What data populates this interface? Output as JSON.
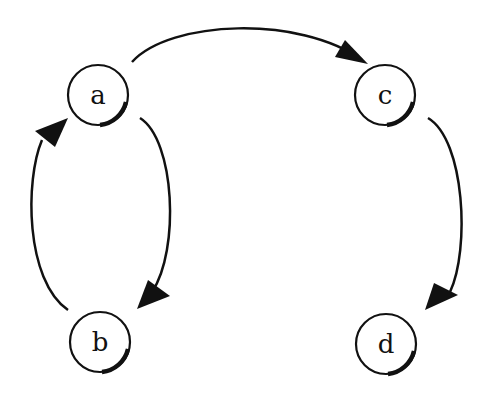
{
  "diagram": {
    "type": "directed-graph",
    "nodes": [
      {
        "id": "a",
        "label": "a"
      },
      {
        "id": "b",
        "label": "b"
      },
      {
        "id": "c",
        "label": "c"
      },
      {
        "id": "d",
        "label": "d"
      }
    ],
    "edges": [
      {
        "from": "a",
        "to": "c"
      },
      {
        "from": "a",
        "to": "b"
      },
      {
        "from": "b",
        "to": "a"
      },
      {
        "from": "c",
        "to": "d"
      }
    ],
    "colors": {
      "stroke": "#111111",
      "background": "#ffffff"
    }
  }
}
